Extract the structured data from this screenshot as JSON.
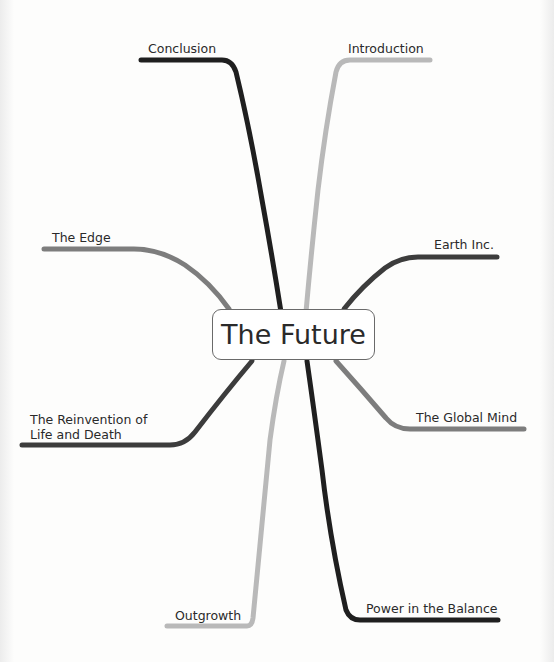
{
  "diagram": {
    "type": "mind-map",
    "central_topic": "The Future",
    "colors": {
      "black": "#1f1f1f",
      "dark_gray": "#3c3c3c",
      "mid_gray": "#7d7d7d",
      "light_gray": "#b9b9b9",
      "node_border": "#6a6a6a",
      "text": "#2a2a2a"
    },
    "branches": [
      {
        "id": "conclusion",
        "label": "Conclusion",
        "side": "top-left",
        "color": "black"
      },
      {
        "id": "introduction",
        "label": "Introduction",
        "side": "top-right",
        "color": "light_gray"
      },
      {
        "id": "the-edge",
        "label": "The Edge",
        "side": "left",
        "color": "mid_gray"
      },
      {
        "id": "earth-inc",
        "label": "Earth Inc.",
        "side": "right",
        "color": "dark_gray"
      },
      {
        "id": "reinvention",
        "label_lines": [
          "The Reinvention of",
          "Life and Death"
        ],
        "side": "left",
        "color": "dark_gray"
      },
      {
        "id": "global-mind",
        "label": "The Global Mind",
        "side": "right",
        "color": "mid_gray"
      },
      {
        "id": "outgrowth",
        "label": "Outgrowth",
        "side": "bottom-left",
        "color": "light_gray"
      },
      {
        "id": "power",
        "label": "Power in the Balance",
        "side": "bottom-right",
        "color": "black"
      }
    ]
  }
}
